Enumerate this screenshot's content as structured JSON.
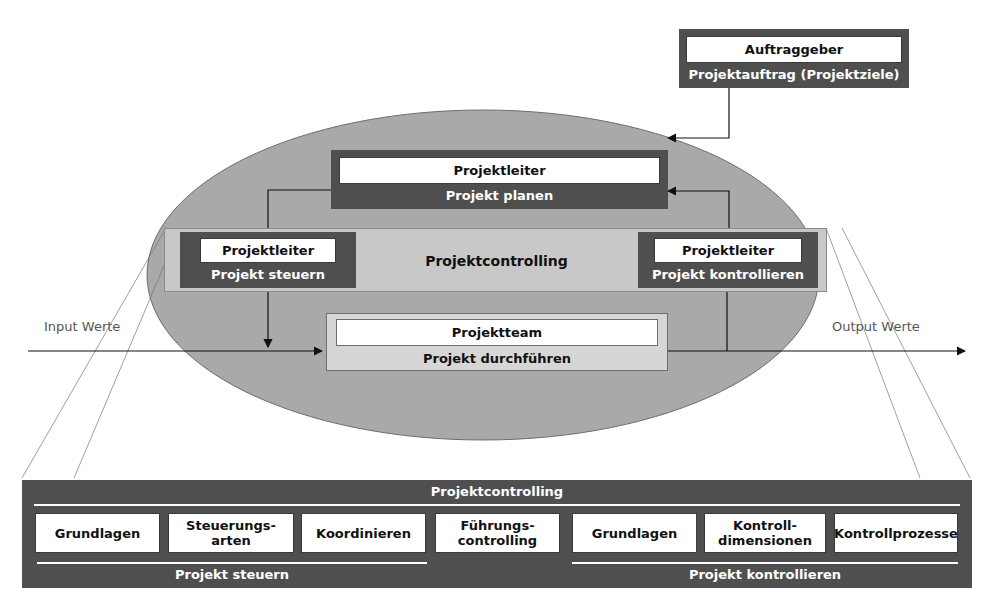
{
  "client": {
    "role": "Auftraggeber",
    "output": "Projektauftrag (Projektziele)"
  },
  "planning": {
    "role": "Projektleiter",
    "activity": "Projekt planen"
  },
  "controlling_band": {
    "label": "Projektcontrolling",
    "steer": {
      "role": "Projektleiter",
      "activity": "Projekt steuern"
    },
    "control": {
      "role": "Projektleiter",
      "activity": "Projekt kontrollieren"
    }
  },
  "execution": {
    "role": "Projektteam",
    "activity": "Projekt durchführen"
  },
  "flow": {
    "input_label": "Input Werte",
    "output_label": "Output Werte"
  },
  "detail_panel": {
    "title": "Projektcontrolling",
    "items": [
      {
        "line1": "Grundlagen",
        "line2": ""
      },
      {
        "line1": "Steuerungs-",
        "line2": "arten"
      },
      {
        "line1": "Koordinieren",
        "line2": ""
      },
      {
        "line1": "Führungs-",
        "line2": "controlling"
      },
      {
        "line1": "Grundlagen",
        "line2": ""
      },
      {
        "line1": "Kontroll-",
        "line2": "dimensionen"
      },
      {
        "line1": "Kontrollprozesse",
        "line2": ""
      }
    ],
    "left_group": "Projekt steuern",
    "right_group": "Projekt kontrollieren"
  },
  "colors": {
    "dark_box": "#4f4f4f",
    "ellipse": "#a9a9a9",
    "band": "#c8c8c8",
    "exec_box": "#d6d6d6"
  }
}
